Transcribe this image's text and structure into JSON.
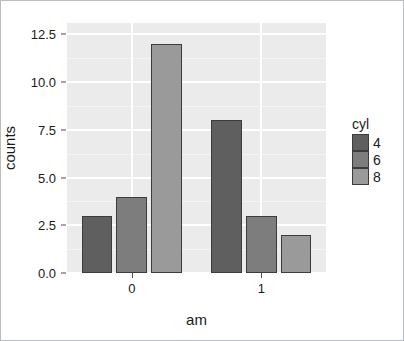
{
  "chart_data": {
    "type": "bar",
    "title": "",
    "xlabel": "am",
    "ylabel": "counts",
    "categories": [
      "0",
      "1"
    ],
    "series": [
      {
        "name": "4",
        "values": [
          3,
          8
        ],
        "color": "#5f5f5f"
      },
      {
        "name": "6",
        "values": [
          4,
          3
        ],
        "color": "#7d7d7d"
      },
      {
        "name": "8",
        "values": [
          12,
          2
        ],
        "color": "#9a9a9a"
      }
    ],
    "legend": {
      "title": "cyl",
      "position": "right",
      "entries": [
        "4",
        "6",
        "8"
      ]
    },
    "ylim": [
      0,
      13.1
    ],
    "yticks": [
      0.0,
      2.5,
      5.0,
      7.5,
      10.0,
      12.5
    ],
    "ytick_labels": [
      "0.0",
      "2.5",
      "5.0",
      "7.5",
      "10.0",
      "12.5"
    ],
    "yminor_ticks": [
      1.25,
      3.75,
      6.25,
      8.75,
      11.25
    ],
    "xtick_labels": [
      "0",
      "1"
    ],
    "grid": true,
    "panel_background": "#ebebeb",
    "grid_color": "#ffffff",
    "bar_border_color": "#3c3c3c"
  }
}
